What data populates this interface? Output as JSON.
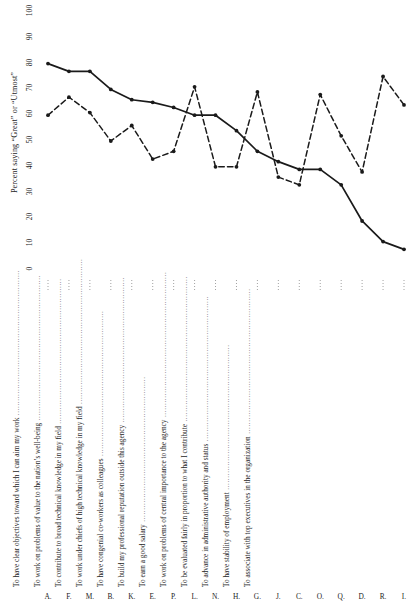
{
  "chart_data": {
    "type": "line",
    "title": "",
    "xlabel": "",
    "ylabel": "Percent saying \"Great\" or \"Utmost\"",
    "ylim": [
      0,
      100
    ],
    "yticks": [
      0,
      10,
      20,
      30,
      40,
      50,
      60,
      70,
      80,
      90,
      100
    ],
    "grid": false,
    "legend": "none",
    "categories": [
      "A.",
      "F.",
      "M.",
      "B.",
      "K.",
      "E.",
      "P.",
      "L.",
      "N.",
      "H.",
      "G.",
      "J.",
      "C.",
      "O.",
      "Q.",
      "D.",
      "R.",
      "I."
    ],
    "series": [
      {
        "name": "Importance",
        "style": "solid",
        "marker": "filled-circle",
        "values": [
          80,
          77,
          77,
          70,
          66,
          65,
          63,
          60,
          60,
          54,
          46,
          42,
          39,
          39,
          33,
          19,
          11,
          8
        ]
      },
      {
        "name": "Fulfillment",
        "style": "dashed",
        "marker": "filled-circle",
        "values": [
          60,
          67,
          61,
          50,
          56,
          43,
          46,
          71,
          40,
          40,
          69,
          36,
          33,
          68,
          52,
          38,
          75,
          64
        ]
      }
    ]
  },
  "axis": {
    "y_title": "Percent saying “Great” or “Utmost”",
    "y_tick_labels": [
      "0",
      "10",
      "20",
      "30",
      "40",
      "50",
      "60",
      "70",
      "80",
      "90",
      "100"
    ]
  },
  "items": [
    {
      "letter": "A.",
      "text": "To make full use of my present knowledge and skills"
    },
    {
      "letter": "F.",
      "text": "To work with colleagues of high technical competence"
    },
    {
      "letter": "M.",
      "text": "To have freedom to carry out my own ideas"
    },
    {
      "letter": "B.",
      "text": "To grow and learn new knowledge skills"
    },
    {
      "letter": "K.",
      "text": "To work on difficult and challenging problems"
    },
    {
      "letter": "E.",
      "text": "To advance in professional respect of colleagues and chiefs"
    },
    {
      "letter": "P.",
      "text": "To have clear objectives toward which I can aim my work"
    },
    {
      "letter": "L.",
      "text": "To work on problems of value to the nation’s well-being"
    },
    {
      "letter": "N.",
      "text": "To contribute to broad technical knowledge in my field"
    },
    {
      "letter": "H.",
      "text": "To work under chiefs of high technical knowledge in my field"
    },
    {
      "letter": "G.",
      "text": "To have congenial co-workers as colleagues"
    },
    {
      "letter": "J.",
      "text": "To build my professional reputation outside this agency"
    },
    {
      "letter": "C.",
      "text": "To earn a good salary"
    },
    {
      "letter": "O.",
      "text": "To work on problems of central importance to the agency"
    },
    {
      "letter": "Q.",
      "text": "To be evaluated fairly in proportion to what I contribute"
    },
    {
      "letter": "D.",
      "text": "To advance in administrative authority and status"
    },
    {
      "letter": "R.",
      "text": "To have stability of employment"
    },
    {
      "letter": "I.",
      "text": "To associate with top executives in the organization"
    }
  ],
  "colors": {
    "ink": "#1a1a1a",
    "leader": "#8a8a8a",
    "background": "#ffffff"
  }
}
